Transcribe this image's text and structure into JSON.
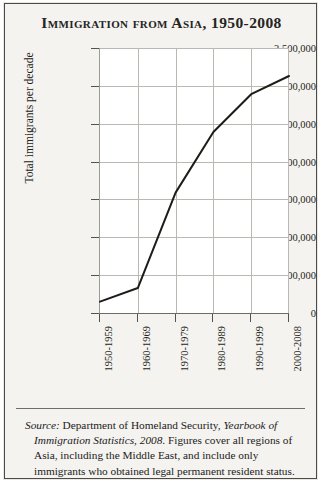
{
  "figure": {
    "title": "Immigration from Asia, 1950-2008",
    "background_color": "#f4f3ef",
    "border_color": "#4b4a46",
    "line_color": "#1d1c18"
  },
  "source_note": {
    "label": "Source:",
    "text_1": " Department of Homeland Security, ",
    "publication": "Yearbook of Immigration Statistics, 2008",
    "text_2": ". Figures cover all regions of Asia, including the Middle East, and include only immigrants who obtained legal permanent resident status."
  },
  "chart_data": {
    "type": "line",
    "title": "Immigration from Asia, 1950-2008",
    "xlabel": "",
    "ylabel": "Total immigrants per decade",
    "categories": [
      "1950-1959",
      "1960-1969",
      "1970-1979",
      "1980-1989",
      "1990-1999",
      "2000-2008"
    ],
    "values": [
      150000,
      330000,
      1590000,
      2390000,
      2890000,
      3130000
    ],
    "ylim": [
      0,
      3500000
    ],
    "ytick_labels": [
      "0",
      "500,000",
      "1,000,000",
      "1,500,000",
      "2,000,000",
      "2,500,000",
      "3,000,000",
      "3,500,000"
    ],
    "ytick_values": [
      0,
      500000,
      1000000,
      1500000,
      2000000,
      2500000,
      3000000,
      3500000
    ],
    "grid": true,
    "legend": "none",
    "series": [
      {
        "name": "Total immigrants per decade",
        "values": [
          150000,
          330000,
          1590000,
          2390000,
          2890000,
          3130000
        ]
      }
    ]
  }
}
